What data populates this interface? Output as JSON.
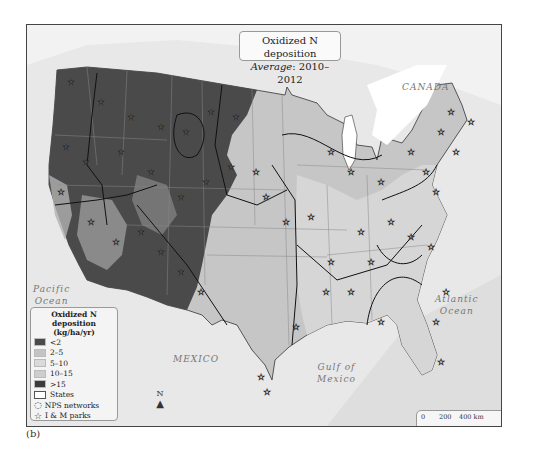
{
  "title": {
    "line1": "Oxidized N deposition",
    "line2_label": "Average",
    "line2_value": ": 2010–2012"
  },
  "geo_labels": {
    "canada": "CANADA",
    "pacific": [
      "Pacific",
      "Ocean"
    ],
    "atlantic": [
      "Atlantic",
      "Ocean"
    ],
    "mexico": "MEXICO",
    "gulf": [
      "Gulf of",
      "Mexico"
    ]
  },
  "legend": {
    "title": "Oxidized N deposition",
    "units": "(kg/ha/yr)",
    "classes": [
      {
        "label": "<2",
        "color": "#4a4a4a"
      },
      {
        "label": "2–5",
        "color": "#c4c4c4"
      },
      {
        "label": "5–10",
        "color": "#dadada"
      },
      {
        "label": "10–15",
        "color": "#cdcdcd"
      },
      {
        "label": ">15",
        "color": "#3c3c3c"
      }
    ],
    "states_label": "States",
    "networks_label": "NPS networks",
    "parks_label": "I & M parks"
  },
  "north_arrow": {
    "label": "N"
  },
  "scale_bar": {
    "km_ticks": [
      "0",
      "200",
      "400 km"
    ],
    "mi_ticks": [
      "0",
      "100",
      "200",
      "400 mi"
    ]
  },
  "caption": "(b)",
  "colors": {
    "west_low": "#4a4a4a",
    "central": "#c4c4c4",
    "east": "#d4d4d4",
    "ocean": "#e4e4e4"
  }
}
